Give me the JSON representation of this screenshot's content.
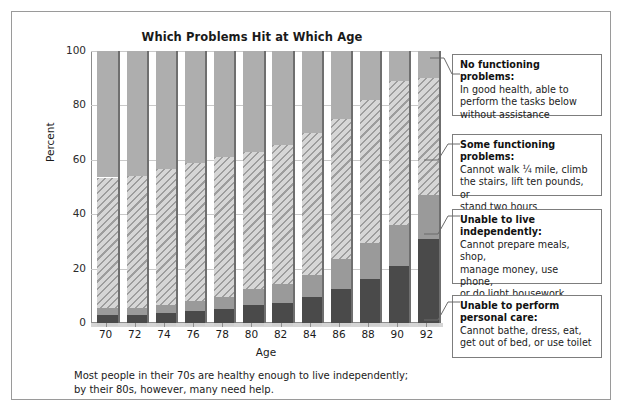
{
  "figure": {
    "title": "Which Problems Hit at Which Age",
    "caption_line1": "Most people in their 70s are healthy enough to live independently;",
    "caption_line2": "by their 80s, however, many need help."
  },
  "callouts": [
    {
      "title": "No functioning problems:",
      "lines": [
        "In good health, able to",
        "perform the tasks below",
        "without assistance"
      ]
    },
    {
      "title": "Some functioning problems:",
      "lines": [
        "Cannot walk ¼ mile, climb",
        "the stairs, lift ten pounds, or",
        "stand two hours"
      ]
    },
    {
      "title": "Unable to live",
      "title2": "independently:",
      "lines": [
        "Cannot prepare meals, shop,",
        "manage money, use phone,",
        "or do light housework"
      ]
    },
    {
      "title": "Unable to perform",
      "title2": "personal care:",
      "lines": [
        "Cannot bathe, dress, eat,",
        "get out of bed, or use toilet"
      ]
    }
  ],
  "colors": {
    "no_problems": "#aeaeae",
    "some_problems": "#d2d2d2",
    "unable_independent": "#9a9a9a",
    "unable_personal_care": "#4a4a4a",
    "frame": "#9a9a9a",
    "grid": "#c9c9c9"
  },
  "chart_data": {
    "type": "bar",
    "stacked": true,
    "title": "Which Problems Hit at Which Age",
    "xlabel": "Age",
    "ylabel": "Percent",
    "ylim": [
      0,
      100
    ],
    "yticks": [
      0,
      20,
      40,
      60,
      80,
      100
    ],
    "grid": true,
    "legend": "callout-boxes-right",
    "categories": [
      70,
      72,
      74,
      76,
      78,
      80,
      82,
      84,
      86,
      88,
      90,
      92
    ],
    "series": [
      {
        "name": "Unable to perform personal care",
        "values": [
          3,
          3,
          3.5,
          4.5,
          5,
          6.5,
          7.5,
          9.5,
          12.5,
          16,
          21,
          31
        ]
      },
      {
        "name": "Unable to live independently",
        "values": [
          2.5,
          2.5,
          3,
          3.5,
          4.5,
          6,
          7,
          8,
          11,
          13.5,
          15,
          16
        ]
      },
      {
        "name": "Some functioning problems",
        "values": [
          48,
          48.5,
          50,
          51,
          51.5,
          50.5,
          51,
          52.5,
          51.5,
          52.5,
          53,
          43
        ]
      },
      {
        "name": "No functioning problems",
        "values": [
          46.5,
          46,
          43.5,
          41,
          39,
          37,
          34.5,
          30,
          25,
          18,
          11,
          10
        ]
      }
    ]
  }
}
